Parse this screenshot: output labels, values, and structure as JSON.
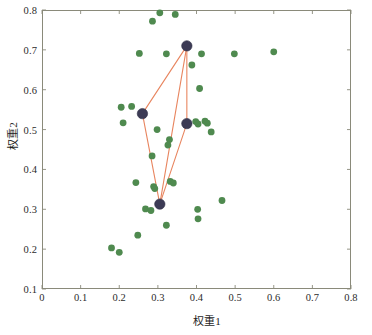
{
  "figure": {
    "background_color": "#ffffff",
    "frame_color": "#8a8a7a"
  },
  "chart_data": {
    "type": "scatter",
    "title": "",
    "xlabel": "权重1",
    "ylabel": "权重2",
    "xlim": [
      0,
      0.8
    ],
    "ylim": [
      0.1,
      0.8
    ],
    "xticks": [
      "0",
      "0.1",
      "0.2",
      "0.3",
      "0.4",
      "0.5",
      "0.6",
      "0.7",
      "0.8"
    ],
    "xtick_values": [
      0,
      0.1,
      0.2,
      0.3,
      0.4,
      0.5,
      0.6,
      0.7,
      0.8
    ],
    "yticks": [
      "0.1",
      "0.2",
      "0.3",
      "0.4",
      "0.5",
      "0.6",
      "0.7",
      "0.8"
    ],
    "ytick_values": [
      0.1,
      0.2,
      0.3,
      0.4,
      0.5,
      0.6,
      0.7,
      0.8
    ],
    "grid": false,
    "legend": "none",
    "series": [
      {
        "name": "population-points",
        "marker": "circle",
        "color": "#4f8a4f",
        "marker_size": 3.4,
        "points": [
          [
            0.305,
            0.793
          ],
          [
            0.345,
            0.789
          ],
          [
            0.286,
            0.772
          ],
          [
            0.252,
            0.691
          ],
          [
            0.322,
            0.69
          ],
          [
            0.413,
            0.69
          ],
          [
            0.498,
            0.69
          ],
          [
            0.375,
            0.71
          ],
          [
            0.205,
            0.556
          ],
          [
            0.232,
            0.558
          ],
          [
            0.26,
            0.54
          ],
          [
            0.21,
            0.517
          ],
          [
            0.388,
            0.662
          ],
          [
            0.298,
            0.5
          ],
          [
            0.33,
            0.475
          ],
          [
            0.326,
            0.461
          ],
          [
            0.408,
            0.603
          ],
          [
            0.285,
            0.434
          ],
          [
            0.375,
            0.515
          ],
          [
            0.398,
            0.52
          ],
          [
            0.404,
            0.514
          ],
          [
            0.422,
            0.521
          ],
          [
            0.428,
            0.516
          ],
          [
            0.438,
            0.494
          ],
          [
            0.243,
            0.367
          ],
          [
            0.289,
            0.357
          ],
          [
            0.292,
            0.352
          ],
          [
            0.332,
            0.37
          ],
          [
            0.34,
            0.366
          ],
          [
            0.305,
            0.313
          ],
          [
            0.268,
            0.301
          ],
          [
            0.282,
            0.297
          ],
          [
            0.322,
            0.26
          ],
          [
            0.403,
            0.3
          ],
          [
            0.466,
            0.322
          ],
          [
            0.404,
            0.276
          ],
          [
            0.248,
            0.235
          ],
          [
            0.18,
            0.203
          ],
          [
            0.2,
            0.192
          ],
          [
            0.6,
            0.695
          ]
        ]
      },
      {
        "name": "selected-nodes",
        "marker": "circle",
        "color": "#3c3b55",
        "marker_size": 5.2,
        "points": [
          [
            0.26,
            0.54
          ],
          [
            0.375,
            0.71
          ],
          [
            0.375,
            0.515
          ],
          [
            0.305,
            0.313
          ]
        ]
      }
    ],
    "connections": {
      "name": "simplex-edges",
      "color": "#e8855f",
      "line_width": 1.1,
      "edges": [
        [
          [
            0.26,
            0.54
          ],
          [
            0.375,
            0.71
          ]
        ],
        [
          [
            0.375,
            0.71
          ],
          [
            0.375,
            0.515
          ]
        ],
        [
          [
            0.375,
            0.71
          ],
          [
            0.305,
            0.313
          ]
        ],
        [
          [
            0.26,
            0.54
          ],
          [
            0.305,
            0.313
          ]
        ],
        [
          [
            0.375,
            0.515
          ],
          [
            0.305,
            0.313
          ]
        ]
      ]
    }
  }
}
